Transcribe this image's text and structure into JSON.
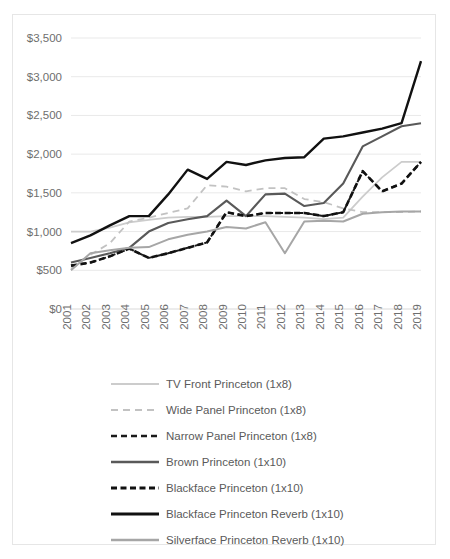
{
  "chart_data": {
    "type": "line",
    "title": "",
    "subtitle": "",
    "xlabel": "",
    "ylabel": "",
    "grid": true,
    "legend_position": "bottom",
    "xlim": [
      2001,
      2019
    ],
    "ylim": [
      0,
      3500
    ],
    "y_tick_step": 500,
    "y_ticks": [
      0,
      500,
      1000,
      1500,
      2000,
      2500,
      3000,
      3500
    ],
    "y_tick_labels": [
      "$0",
      "$500",
      "$1,000",
      "$1,500",
      "$2,000",
      "$2,500",
      "$3,000",
      "$3,500"
    ],
    "categories": [
      2001,
      2002,
      2003,
      2004,
      2005,
      2006,
      2007,
      2008,
      2009,
      2010,
      2011,
      2012,
      2013,
      2014,
      2015,
      2016,
      2017,
      2018,
      2019
    ],
    "x_tick_labels": [
      "2001",
      "2002",
      "2003",
      "2004",
      "2005",
      "2006",
      "2007",
      "2008",
      "2009",
      "2010",
      "2011",
      "2012",
      "2013",
      "2014",
      "2015",
      "2016",
      "2017",
      "2018",
      "2019"
    ],
    "series": [
      {
        "name": "TV Front Princeton (1x8)",
        "style": "solid",
        "color": "#cccccc",
        "width": 1.8,
        "values": [
          1000,
          1000,
          1050,
          1120,
          1150,
          1180,
          1190,
          1190,
          1200,
          1200,
          1200,
          1190,
          1180,
          1160,
          1180,
          1450,
          1700,
          1900,
          1900
        ]
      },
      {
        "name": "Wide Panel Princeton (1x8)",
        "style": "dashed-light",
        "color": "#c2c2c2",
        "width": 1.8,
        "values": [
          520,
          700,
          850,
          1130,
          1180,
          1240,
          1300,
          1600,
          1580,
          1520,
          1560,
          1560,
          1420,
          1380,
          1300,
          1250,
          1250,
          1250,
          1260
        ]
      },
      {
        "name": "Narrow Panel Princeton (1x8)",
        "style": "dashed-dark",
        "color": "#1a1a1a",
        "width": 2.0,
        "values": [
          560,
          600,
          680,
          780,
          660,
          720,
          790,
          860,
          1250,
          1200,
          1240,
          1240,
          1240,
          1200,
          1250,
          1780,
          1520,
          1620,
          1900
        ]
      },
      {
        "name": "Brown Princeton (1x10)",
        "style": "solid",
        "color": "#595959",
        "width": 2.1,
        "values": [
          600,
          660,
          720,
          790,
          1000,
          1110,
          1160,
          1200,
          1400,
          1200,
          1480,
          1490,
          1330,
          1370,
          1620,
          2100,
          2230,
          2360,
          2400
        ]
      },
      {
        "name": "Blackface Princeton (1x10)",
        "style": "dashed-heavy",
        "color": "#111111",
        "width": 2.6,
        "values": [
          560,
          600,
          680,
          780,
          660,
          720,
          790,
          860,
          1250,
          1200,
          1240,
          1240,
          1240,
          1200,
          1250,
          1780,
          1520,
          1620,
          1900
        ]
      },
      {
        "name": "Blackface Princeton Reverb (1x10)",
        "style": "solid",
        "color": "#111111",
        "width": 2.4,
        "values": [
          850,
          950,
          1080,
          1200,
          1200,
          1480,
          1800,
          1680,
          1900,
          1860,
          1920,
          1950,
          1960,
          2200,
          2230,
          2280,
          2330,
          2400,
          3200
        ]
      },
      {
        "name": "Silverface Princeton Reverb (1x10)",
        "style": "solid",
        "color": "#a6a6a6",
        "width": 2.0,
        "values": [
          500,
          720,
          760,
          790,
          800,
          900,
          960,
          1000,
          1060,
          1040,
          1120,
          720,
          1130,
          1140,
          1130,
          1230,
          1250,
          1260,
          1260
        ]
      }
    ]
  },
  "legend": {
    "items": [
      {
        "label": "TV Front Princeton (1x8)",
        "swatch": "solid-light-line-icon"
      },
      {
        "label": "Wide Panel Princeton (1x8)",
        "swatch": "dashed-light-line-icon"
      },
      {
        "label": "Narrow Panel Princeton (1x8)",
        "swatch": "dashed-dark-line-icon"
      },
      {
        "label": "Brown Princeton (1x10)",
        "swatch": "solid-dark-line-icon"
      },
      {
        "label": "Blackface Princeton (1x10)",
        "swatch": "dashed-heavy-line-icon"
      },
      {
        "label": "Blackface Princeton Reverb (1x10)",
        "swatch": "solid-black-line-icon"
      },
      {
        "label": "Silverface Princeton Reverb (1x10)",
        "swatch": "solid-gray-line-icon"
      }
    ]
  }
}
